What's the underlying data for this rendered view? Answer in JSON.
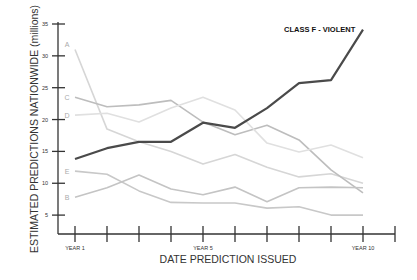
{
  "chart_data": {
    "type": "line",
    "title": "",
    "annotations": [
      {
        "text": "CLASS F - VIOLENT",
        "near_series": "F"
      }
    ],
    "xlabel": "DATE PREDICTION ISSUED",
    "ylabel": "ESTIMATED PREDICTIONS NATIONWIDE (millions)",
    "x": [
      1,
      2,
      3,
      4,
      5,
      6,
      7,
      8,
      9,
      10
    ],
    "x_tick_positions": [
      1,
      2,
      3,
      4,
      5,
      6,
      7,
      8,
      9,
      10,
      11
    ],
    "x_tick_labels": {
      "1": "YEAR 1",
      "5": "YEAR 5",
      "10": "YEAR 10"
    },
    "y_ticks": [
      5,
      10,
      15,
      20,
      25,
      30,
      35
    ],
    "ylim": [
      2,
      35
    ],
    "grid": false,
    "legend": "inline series labels at left of lines",
    "series": [
      {
        "name": "A",
        "color": "#d6d6d6",
        "width": 1.6,
        "values": [
          31,
          18.5,
          16.5,
          15,
          13,
          14.5,
          12.5,
          11,
          11.5,
          10
        ]
      },
      {
        "name": "C",
        "color": "#bdbdbd",
        "width": 1.6,
        "values": [
          23.5,
          22,
          22.3,
          23,
          19.6,
          17.6,
          19.1,
          16.8,
          12.1,
          8.5
        ]
      },
      {
        "name": "D",
        "color": "#e0e0e0",
        "width": 1.6,
        "values": [
          20.7,
          21,
          19.6,
          21.8,
          23.5,
          21.5,
          16.3,
          14.9,
          16,
          14
        ]
      },
      {
        "name": "E",
        "color": "#c8c8c8",
        "width": 1.6,
        "values": [
          11.9,
          11.4,
          8.8,
          7,
          6.9,
          6.9,
          6.1,
          6.3,
          5,
          5
        ]
      },
      {
        "name": "B",
        "color": "#c4c4c4",
        "width": 1.6,
        "values": [
          7.8,
          9.3,
          11.3,
          9.1,
          8.2,
          9.4,
          7.1,
          9.3,
          9.4,
          9.3
        ]
      },
      {
        "name": "F",
        "label": "CLASS F - VIOLENT",
        "color": "#4a4a4a",
        "width": 2.2,
        "values": [
          13.8,
          15.5,
          16.5,
          16.5,
          19.5,
          18.7,
          21.8,
          25.7,
          26.2,
          34.1
        ]
      }
    ]
  }
}
